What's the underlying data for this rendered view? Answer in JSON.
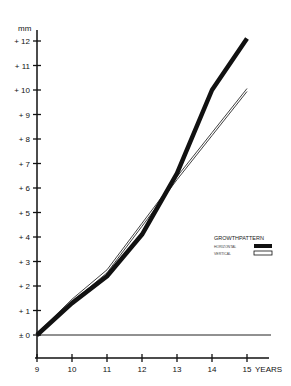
{
  "chart_data": {
    "type": "line",
    "title": "",
    "xlabel": "YEARS",
    "ylabel": "mm",
    "x": [
      9,
      10,
      11,
      12,
      13,
      14,
      15
    ],
    "xlim": [
      9,
      15
    ],
    "ylim": [
      -1,
      12
    ],
    "x_ticks": [
      "9",
      "10",
      "11",
      "12",
      "13",
      "14",
      "15"
    ],
    "y_ticks": [
      "± 0",
      "+ 1",
      "+ 2",
      "+ 3",
      "+ 4",
      "+ 5",
      "+ 6",
      "+ 7",
      "+ 8",
      "+ 9",
      "+ 10",
      "+ 11",
      "+ 12"
    ],
    "grid": false,
    "legend_position": "right",
    "legend_title": "GROWTHPATTERN",
    "series": [
      {
        "name": "HORIZONTAL",
        "style": "filled-black",
        "values": [
          0,
          1.3,
          2.4,
          4.1,
          6.6,
          10.0,
          12.1
        ]
      },
      {
        "name": "VERTICAL",
        "style": "outline",
        "values": [
          0,
          1.4,
          2.6,
          4.5,
          6.4,
          8.2,
          10.0
        ]
      }
    ],
    "reference_line": {
      "y": 0
    }
  },
  "axis": {
    "y_unit": "mm",
    "x_unit": "YEARS"
  },
  "legend": {
    "title": "GROWTHPATTERN",
    "items": [
      "HORIZONTAL",
      "VERTICAL"
    ]
  }
}
